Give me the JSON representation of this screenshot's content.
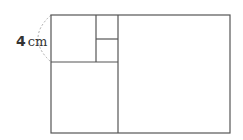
{
  "diagram": {
    "label": {
      "value": "4",
      "unit": "cm"
    },
    "colors": {
      "line": "#555555",
      "arc": "#aaaaaa",
      "text": "#333333"
    }
  }
}
